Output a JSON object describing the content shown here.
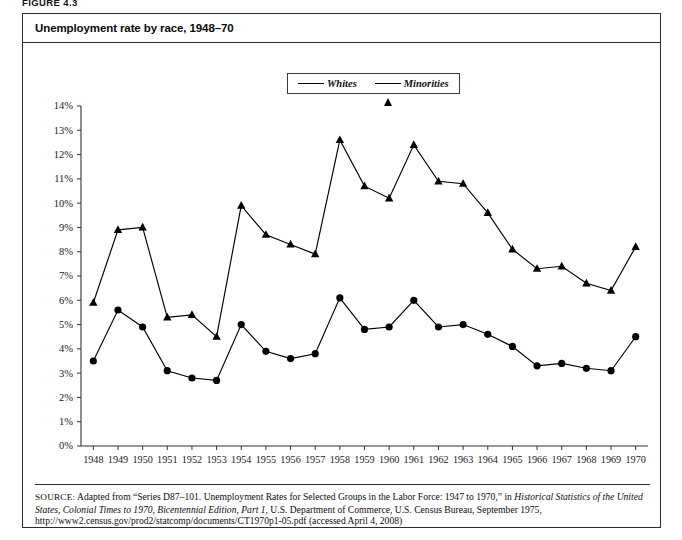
{
  "figure": {
    "number_label": "FIGURE 4.3",
    "title": "Unemployment rate by race, 1948–70"
  },
  "legend": {
    "position": "top-center",
    "entries": [
      {
        "label": "Whites",
        "marker": "circle-marker",
        "color": "#000000"
      },
      {
        "label": "Minorities",
        "marker": "triangle-marker",
        "color": "#000000"
      }
    ]
  },
  "source": {
    "label": "SOURCE:",
    "text_part1": " Adapted from “Series D87–101. Unemployment Rates for Selected Groups in the Labor Force: 1947 to 1970,” in ",
    "italic1": "Historical Statistics of the United States, Colonial Times to 1970, Bicentennial Edition, Part 1",
    "text_part2": ", U.S. Department of Commerce, U.S. Census Bureau, September 1975, http://www2.census.gov/prod2/statcomp/documents/CT1970p1-05.pdf (accessed April 4, 2008)"
  },
  "chart_data": {
    "type": "line",
    "title": "Unemployment rate by race, 1948–70",
    "xlabel": "",
    "ylabel": "",
    "grid": false,
    "legend_position": "top-center",
    "categories": [
      "1948",
      "1949",
      "1950",
      "1951",
      "1952",
      "1953",
      "1954",
      "1955",
      "1956",
      "1957",
      "1958",
      "1959",
      "1960",
      "1961",
      "1962",
      "1963",
      "1964",
      "1965",
      "1966",
      "1967",
      "1968",
      "1969",
      "1970"
    ],
    "x": [
      1948,
      1949,
      1950,
      1951,
      1952,
      1953,
      1954,
      1955,
      1956,
      1957,
      1958,
      1959,
      1960,
      1961,
      1962,
      1963,
      1964,
      1965,
      1966,
      1967,
      1968,
      1969,
      1970
    ],
    "ylim": [
      0,
      14
    ],
    "yticks": [
      0,
      1,
      2,
      3,
      4,
      5,
      6,
      7,
      8,
      9,
      10,
      11,
      12,
      13,
      14
    ],
    "ytick_labels": [
      "0%",
      "1%",
      "2%",
      "3%",
      "4%",
      "5%",
      "6%",
      "7%",
      "8%",
      "9%",
      "10%",
      "11%",
      "12%",
      "13%",
      "14%"
    ],
    "series": [
      {
        "name": "Whites",
        "marker": "circle",
        "values": [
          3.5,
          5.6,
          4.9,
          3.1,
          2.8,
          2.7,
          5.0,
          3.9,
          3.6,
          3.8,
          6.1,
          4.8,
          4.9,
          6.0,
          4.9,
          5.0,
          4.6,
          4.1,
          3.3,
          3.4,
          3.2,
          3.1,
          4.5
        ]
      },
      {
        "name": "Minorities",
        "marker": "triangle",
        "values": [
          5.9,
          8.9,
          9.0,
          5.3,
          5.4,
          4.5,
          9.9,
          8.7,
          8.3,
          7.9,
          12.6,
          10.7,
          10.2,
          12.4,
          10.9,
          10.8,
          9.6,
          8.1,
          7.3,
          7.4,
          6.7,
          6.4,
          8.2
        ]
      }
    ]
  }
}
